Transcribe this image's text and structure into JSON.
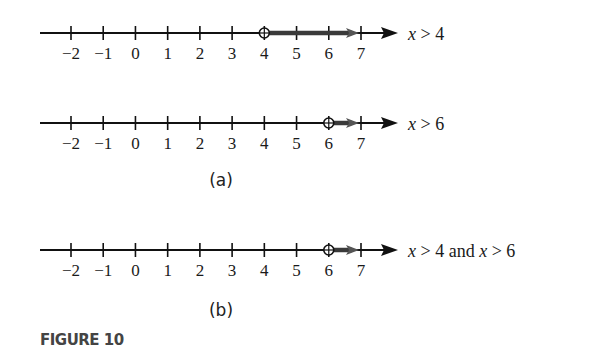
{
  "figure": {
    "caption": "FIGURE 10",
    "panels": [
      {
        "label": "(a)"
      },
      {
        "label": "(b)"
      }
    ],
    "number_lines": [
      {
        "id": "line-1",
        "panel": "(a)",
        "inequality_var": "x",
        "inequality_text": " > 4",
        "open_circle_at": 4,
        "shaded_direction": "right",
        "y": 33
      },
      {
        "id": "line-2",
        "panel": "(a)",
        "inequality_var": "x",
        "inequality_text": " > 6",
        "open_circle_at": 6,
        "shaded_direction": "right",
        "y": 123
      },
      {
        "id": "line-3",
        "panel": "(b)",
        "inequality_parts": [
          "x",
          " > 4 and ",
          "x",
          " > 6"
        ],
        "open_circle_at": 6,
        "shaded_direction": "right",
        "y": 250
      }
    ],
    "tick_labels": [
      "−2",
      "−1",
      "0",
      "1",
      "2",
      "3",
      "4",
      "5",
      "6",
      "7"
    ],
    "tick_values": [
      -2,
      -1,
      0,
      1,
      2,
      3,
      4,
      5,
      6,
      7
    ]
  },
  "colors": {
    "axis": "#111111",
    "shade": "#3a3a3a",
    "shade_arrow": "#555555",
    "caption": "#444444"
  }
}
